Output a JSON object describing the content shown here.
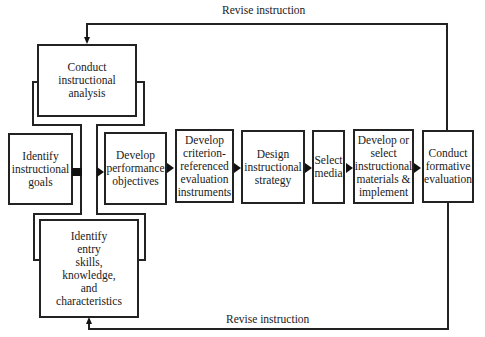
{
  "diagram": {
    "type": "flowchart",
    "feedback_top_label": "Revise instruction",
    "feedback_bottom_label": "Revise instruction",
    "nodes": [
      {
        "id": "instructional-analysis",
        "label": "Conduct\ninstructional\nanalysis"
      },
      {
        "id": "instructional-goals",
        "label": "Identify\ninstructional\ngoals"
      },
      {
        "id": "entry-skills",
        "label": "Identify\nentry\nskills,\nknowledge,\nand\ncharacteristics"
      },
      {
        "id": "performance-objectives",
        "label": "Develop\nperformance\nobjectives"
      },
      {
        "id": "criterion-instruments",
        "label": "Develop\ncriterion-\nreferenced\nevaluation\ninstruments"
      },
      {
        "id": "instructional-strategy",
        "label": "Design\ninstructional\nstrategy"
      },
      {
        "id": "select-media",
        "label": "Select\nmedia"
      },
      {
        "id": "develop-materials",
        "label": "Develop or\nselect\ninstructional\nmaterials &\nimplement"
      },
      {
        "id": "formative-evaluation",
        "label": "Conduct\nformative\nevaluation"
      }
    ],
    "edges": [
      {
        "from": "instructional-goals",
        "to": "instructional-analysis"
      },
      {
        "from": "instructional-goals",
        "to": "entry-skills"
      },
      {
        "from": "instructional-goals",
        "to": "performance-objectives"
      },
      {
        "from": "performance-objectives",
        "to": "criterion-instruments"
      },
      {
        "from": "criterion-instruments",
        "to": "instructional-strategy"
      },
      {
        "from": "instructional-strategy",
        "to": "select-media"
      },
      {
        "from": "select-media",
        "to": "develop-materials"
      },
      {
        "from": "develop-materials",
        "to": "formative-evaluation"
      },
      {
        "from": "formative-evaluation",
        "to": "instructional-analysis",
        "label": "Revise instruction"
      },
      {
        "from": "formative-evaluation",
        "to": "entry-skills",
        "label": "Revise instruction"
      }
    ]
  }
}
